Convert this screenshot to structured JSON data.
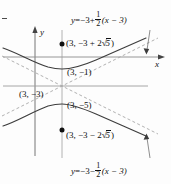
{
  "figure": {
    "kind": "hyperbola-graph",
    "axes": {
      "x_label": "x",
      "y_label": "y"
    },
    "equations": {
      "upper_asymptote": {
        "lhs": "y",
        "eq": "=",
        "term1": "−3",
        "op": "+",
        "frac_num": "1",
        "frac_den": "2",
        "factor": "(x − 3)",
        "full": "y = −3 + 1/2(x − 3)"
      },
      "lower_asymptote": {
        "lhs": "y",
        "eq": "=",
        "term1": "−3",
        "op": "−",
        "frac_num": "1",
        "frac_den": "2",
        "factor": "(x − 3)",
        "full": "y = −3 − 1/2(x − 3)"
      }
    },
    "points": {
      "focus_upper": {
        "open": "(3, −3 + 2",
        "radical": "5",
        "close": ")",
        "full": "(3, −3 + 2√5)"
      },
      "vertex_upper": "(3, −1)",
      "center": "(3, −3)",
      "vertex_lower": "(3, −5)",
      "focus_lower": {
        "open": "(3, −3 − 2",
        "radical": "5",
        "close": ")",
        "full": "(3, −3 − 2√5)"
      }
    },
    "colors": {
      "curve": "#3a3a3a",
      "axis": "#555555",
      "asymptote": "#9a9a9a",
      "text": "#111111",
      "background": "#fdfdfd"
    }
  }
}
